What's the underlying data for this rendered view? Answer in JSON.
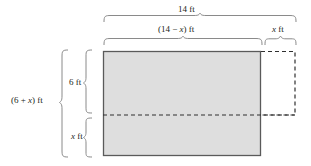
{
  "figure": {
    "colors": {
      "fill": "#dedede",
      "stroke": "#6e6e6e",
      "solid_edge": "#555555",
      "text": "#231f20",
      "brace": "#7a7a7a"
    },
    "labels": {
      "total_width": "14 ft",
      "left_width_prefix": "(14 − ",
      "left_width_var": "x",
      "left_width_suffix": ") ft",
      "right_width_var": "x",
      "right_width_suffix": " ft",
      "total_height_prefix": "(6 + ",
      "total_height_var": "x",
      "total_height_suffix": ") ft",
      "upper_height": "6 ft",
      "lower_height_var": "x",
      "lower_height_suffix": " ft"
    },
    "geometry": {
      "shaded_rect": {
        "x": 103,
        "y": 51,
        "width": 158,
        "height": 105
      },
      "dashed_extension_rect": {
        "x": 261,
        "y": 51,
        "width": 34,
        "height": 64
      },
      "interior_dashed_line_y": 115,
      "top_brace_14ft": {
        "x1": 104,
        "x2": 296,
        "y": 17
      },
      "brace_14_minus_x": {
        "x1": 104,
        "x2": 262,
        "y": 39
      },
      "brace_x_ft_top": {
        "x1": 265,
        "x2": 296,
        "y": 39
      },
      "brace_6_plus_x": {
        "y1": 50,
        "y2": 157,
        "x": 68
      },
      "brace_6ft": {
        "y1": 50,
        "y2": 113,
        "x": 92
      },
      "brace_x_ft_side": {
        "y1": 118,
        "y2": 157,
        "x": 92
      }
    },
    "measurements": {
      "total_width_ft": 14,
      "left_width_expr": "14 - x",
      "right_width_expr": "x",
      "total_height_expr": "6 + x",
      "upper_height_ft": 6,
      "lower_height_expr": "x"
    }
  }
}
